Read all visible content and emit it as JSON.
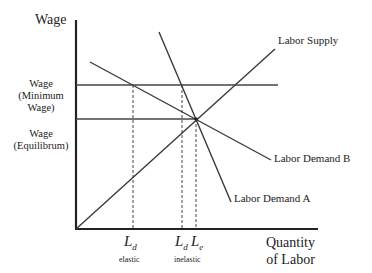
{
  "axes": {
    "y_title": "Wage",
    "x_title_line1": "Quantity",
    "x_title_line2": "of Labor"
  },
  "wage_levels": {
    "minimum": {
      "line1": "Wage",
      "line2": "(Minimum",
      "line3": "Wage)"
    },
    "equilibrium": {
      "line1": "Wage",
      "line2": "(Equilibrum)"
    }
  },
  "curves": {
    "supply": "Labor Supply",
    "demand_a": "Labor Demand A",
    "demand_b": "Labor Demand B"
  },
  "x_ticks": {
    "ld_elastic": {
      "main": "L",
      "sub": "d",
      "note": "elastic"
    },
    "ld_inelastic": {
      "main": "L",
      "sub": "d",
      "note": "inelastic"
    },
    "le": {
      "main": "L",
      "sub": "e"
    }
  },
  "colors": {
    "line": "#3a3a3a",
    "axis": "#222222"
  }
}
